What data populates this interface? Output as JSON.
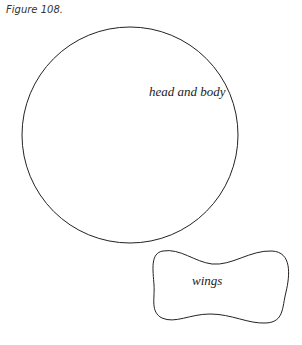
{
  "figure": {
    "caption": "Figure 108.",
    "shapes": [
      {
        "name": "head-and-body",
        "type": "circle",
        "label": "head and body",
        "cx": 130,
        "cy": 135,
        "r": 108
      },
      {
        "name": "wings",
        "type": "bowtie",
        "label": "wings"
      }
    ],
    "stroke_color": "#222222",
    "background": "#ffffff"
  }
}
